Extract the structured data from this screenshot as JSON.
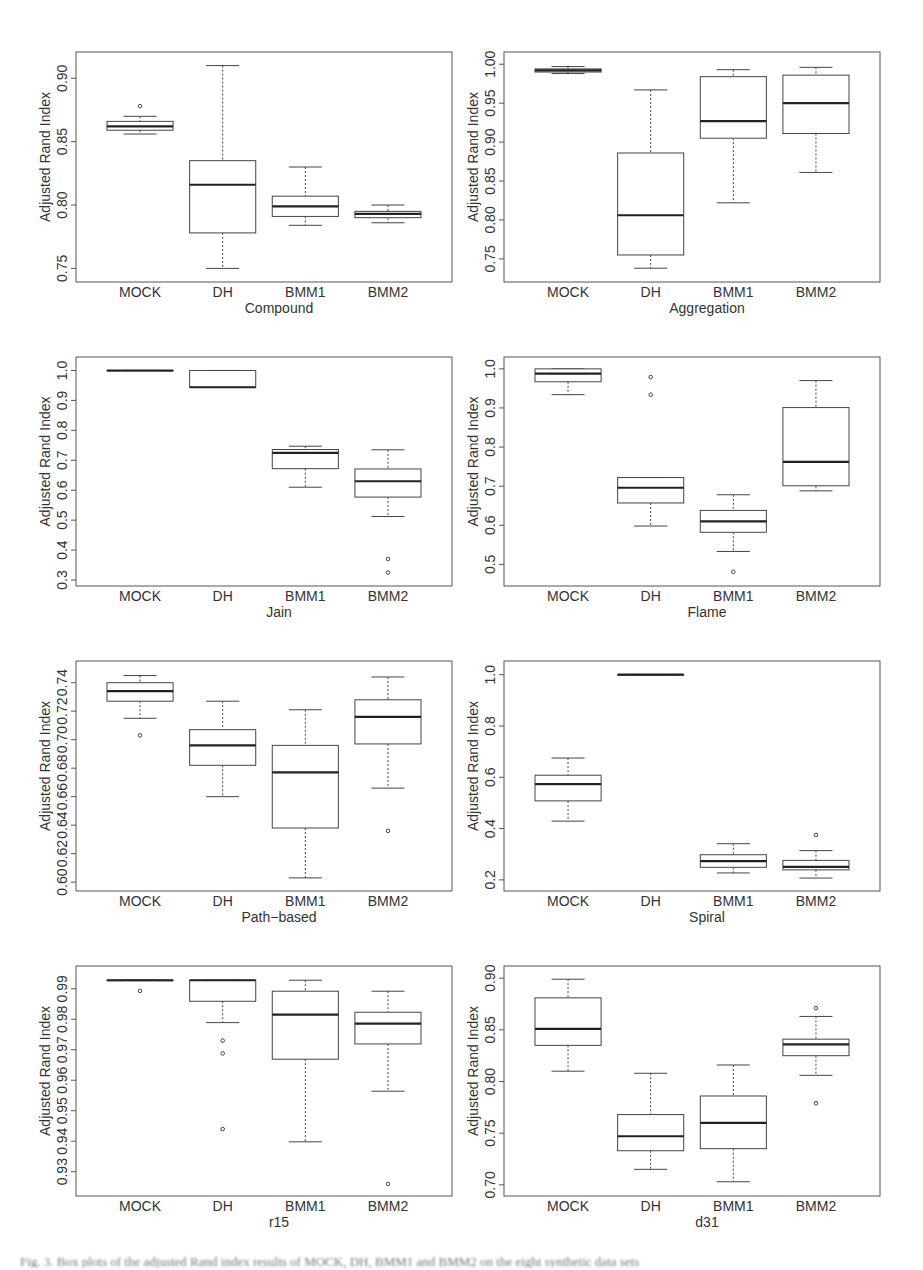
{
  "figure": {
    "caption": "Fig. 3. Box plots of the adjusted Rand index results of MOCK, DH, BMM1 and BMM2 on the eight synthetic data sets",
    "ylabel": "Adjusted Rand Index",
    "colors": {
      "frame": "#555555",
      "box": "#444444",
      "median": "#222222",
      "background": "#ffffff"
    }
  },
  "chart_data": [
    {
      "type": "boxplot",
      "title": "Compound",
      "xlabel": "Compound",
      "ylabel": "Adjusted Rand Index",
      "categories": [
        "MOCK",
        "DH",
        "BMM1",
        "BMM2"
      ],
      "yticks": [
        0.75,
        0.8,
        0.85,
        0.9
      ],
      "ytick_labels": [
        "0.75",
        "0.80",
        "0.85",
        "0.90"
      ],
      "ylim": [
        0.744,
        0.916
      ],
      "boxes": [
        {
          "min": 0.856,
          "q1": 0.859,
          "median": 0.862,
          "q3": 0.866,
          "max": 0.87,
          "outliers": [
            0.878
          ]
        },
        {
          "min": 0.75,
          "q1": 0.778,
          "median": 0.816,
          "q3": 0.835,
          "max": 0.91,
          "outliers": []
        },
        {
          "min": 0.784,
          "q1": 0.791,
          "median": 0.799,
          "q3": 0.807,
          "max": 0.83,
          "outliers": []
        },
        {
          "min": 0.786,
          "q1": 0.79,
          "median": 0.793,
          "q3": 0.795,
          "max": 0.8,
          "outliers": []
        }
      ]
    },
    {
      "type": "boxplot",
      "title": "Aggregation",
      "xlabel": "Aggregation",
      "ylabel": "Adjusted Rand Index",
      "categories": [
        "MOCK",
        "DH",
        "BMM1",
        "BMM2"
      ],
      "yticks": [
        0.75,
        0.8,
        0.85,
        0.9,
        0.95,
        1.0
      ],
      "ytick_labels": [
        "0.75",
        "0.80",
        "0.85",
        "0.90",
        "0.95",
        "1.00"
      ],
      "ylim": [
        0.728,
        1.008
      ],
      "boxes": [
        {
          "min": 0.988,
          "q1": 0.99,
          "median": 0.992,
          "q3": 0.994,
          "max": 0.997,
          "outliers": []
        },
        {
          "min": 0.738,
          "q1": 0.755,
          "median": 0.806,
          "q3": 0.886,
          "max": 0.967,
          "outliers": []
        },
        {
          "min": 0.822,
          "q1": 0.905,
          "median": 0.927,
          "q3": 0.984,
          "max": 0.993,
          "outliers": []
        },
        {
          "min": 0.861,
          "q1": 0.911,
          "median": 0.95,
          "q3": 0.986,
          "max": 0.996,
          "outliers": []
        }
      ]
    },
    {
      "type": "boxplot",
      "title": "Jain",
      "xlabel": "Jain",
      "ylabel": "Adjusted Rand Index",
      "categories": [
        "MOCK",
        "DH",
        "BMM1",
        "BMM2"
      ],
      "yticks": [
        0.3,
        0.4,
        0.5,
        0.6,
        0.7,
        0.8,
        0.9,
        1.0
      ],
      "ytick_labels": [
        "0.3",
        "0.4",
        "0.5",
        "0.6",
        "0.7",
        "0.8",
        "0.9",
        "1.0"
      ],
      "ylim": [
        0.3,
        1.025
      ],
      "boxes": [
        {
          "min": 1.0,
          "q1": 1.0,
          "median": 1.0,
          "q3": 1.0,
          "max": 1.0,
          "outliers": []
        },
        {
          "min": 0.944,
          "q1": 0.944,
          "median": 0.944,
          "q3": 1.0,
          "max": 1.0,
          "outliers": []
        },
        {
          "min": 0.61,
          "q1": 0.672,
          "median": 0.725,
          "q3": 0.736,
          "max": 0.747,
          "outliers": []
        },
        {
          "min": 0.512,
          "q1": 0.577,
          "median": 0.63,
          "q3": 0.671,
          "max": 0.735,
          "outliers": [
            0.37,
            0.325
          ]
        }
      ]
    },
    {
      "type": "boxplot",
      "title": "Flame",
      "xlabel": "Flame",
      "ylabel": "Adjusted Rand Index",
      "categories": [
        "MOCK",
        "DH",
        "BMM1",
        "BMM2"
      ],
      "yticks": [
        0.5,
        0.6,
        0.7,
        0.8,
        0.9,
        1.0
      ],
      "ytick_labels": [
        "0.5",
        "0.6",
        "0.7",
        "0.8",
        "0.9",
        "1.0"
      ],
      "ylim": [
        0.46,
        1.015
      ],
      "boxes": [
        {
          "min": 0.934,
          "q1": 0.967,
          "median": 0.988,
          "q3": 1.0,
          "max": 1.0,
          "outliers": []
        },
        {
          "min": 0.598,
          "q1": 0.657,
          "median": 0.696,
          "q3": 0.722,
          "max": 0.722,
          "outliers": [
            0.979,
            0.934
          ]
        },
        {
          "min": 0.533,
          "q1": 0.582,
          "median": 0.61,
          "q3": 0.638,
          "max": 0.678,
          "outliers": [
            0.481
          ]
        },
        {
          "min": 0.688,
          "q1": 0.701,
          "median": 0.762,
          "q3": 0.901,
          "max": 0.97,
          "outliers": []
        }
      ]
    },
    {
      "type": "boxplot",
      "title": "Path-based",
      "xlabel": "Path−based",
      "ylabel": "Adjusted Rand Index",
      "categories": [
        "MOCK",
        "DH",
        "BMM1",
        "BMM2"
      ],
      "yticks": [
        0.6,
        0.62,
        0.64,
        0.66,
        0.68,
        0.7,
        0.72,
        0.74
      ],
      "ytick_labels": [
        "0.60",
        "0.62",
        "0.64",
        "0.66",
        "0.68",
        "0.70",
        "0.72",
        "0.74"
      ],
      "ylim": [
        0.598,
        0.751
      ],
      "boxes": [
        {
          "min": 0.715,
          "q1": 0.727,
          "median": 0.734,
          "q3": 0.74,
          "max": 0.745,
          "outliers": [
            0.703
          ]
        },
        {
          "min": 0.66,
          "q1": 0.682,
          "median": 0.696,
          "q3": 0.707,
          "max": 0.727,
          "outliers": []
        },
        {
          "min": 0.603,
          "q1": 0.638,
          "median": 0.677,
          "q3": 0.696,
          "max": 0.721,
          "outliers": []
        },
        {
          "min": 0.666,
          "q1": 0.697,
          "median": 0.716,
          "q3": 0.728,
          "max": 0.744,
          "outliers": [
            0.636
          ]
        }
      ]
    },
    {
      "type": "boxplot",
      "title": "Spiral",
      "xlabel": "Spiral",
      "ylabel": "Adjusted Rand Index",
      "categories": [
        "MOCK",
        "DH",
        "BMM1",
        "BMM2"
      ],
      "yticks": [
        0.2,
        0.4,
        0.6,
        0.8,
        1.0
      ],
      "ytick_labels": [
        "0.2",
        "0.4",
        "0.6",
        "0.8",
        "1.0"
      ],
      "ylim": [
        0.18,
        1.03
      ],
      "boxes": [
        {
          "min": 0.429,
          "q1": 0.508,
          "median": 0.573,
          "q3": 0.608,
          "max": 0.675,
          "outliers": []
        },
        {
          "min": 1.0,
          "q1": 1.0,
          "median": 1.0,
          "q3": 1.0,
          "max": 1.0,
          "outliers": []
        },
        {
          "min": 0.227,
          "q1": 0.249,
          "median": 0.273,
          "q3": 0.298,
          "max": 0.341,
          "outliers": []
        },
        {
          "min": 0.207,
          "q1": 0.239,
          "median": 0.251,
          "q3": 0.276,
          "max": 0.314,
          "outliers": [
            0.375
          ]
        }
      ]
    },
    {
      "type": "boxplot",
      "title": "r15",
      "xlabel": "r15",
      "ylabel": "Adjusted Rand Index",
      "categories": [
        "MOCK",
        "DH",
        "BMM1",
        "BMM2"
      ],
      "yticks": [
        0.93,
        0.94,
        0.95,
        0.96,
        0.97,
        0.98,
        0.99
      ],
      "ytick_labels": [
        "0.93",
        "0.94",
        "0.95",
        "0.96",
        "0.97",
        "0.98",
        "0.99"
      ],
      "ylim": [
        0.924,
        0.9955
      ],
      "boxes": [
        {
          "min": 0.9928,
          "q1": 0.9928,
          "median": 0.9928,
          "q3": 0.9928,
          "max": 0.9928,
          "outliers": [
            0.9893
          ]
        },
        {
          "min": 0.9789,
          "q1": 0.9859,
          "median": 0.9928,
          "q3": 0.9928,
          "max": 0.9928,
          "outliers": [
            0.973,
            0.9688,
            0.944
          ]
        },
        {
          "min": 0.9398,
          "q1": 0.9669,
          "median": 0.9815,
          "q3": 0.9892,
          "max": 0.9928,
          "outliers": []
        },
        {
          "min": 0.9564,
          "q1": 0.9719,
          "median": 0.9786,
          "q3": 0.9823,
          "max": 0.9892,
          "outliers": [
            0.926
          ]
        }
      ]
    },
    {
      "type": "boxplot",
      "title": "d31",
      "xlabel": "d31",
      "ylabel": "Adjusted Rand Index",
      "categories": [
        "MOCK",
        "DH",
        "BMM1",
        "BMM2"
      ],
      "yticks": [
        0.7,
        0.75,
        0.8,
        0.85,
        0.9
      ],
      "ytick_labels": [
        "0.70",
        "0.75",
        "0.80",
        "0.85",
        "0.90"
      ],
      "ylim": [
        0.695,
        0.906
      ],
      "boxes": [
        {
          "min": 0.81,
          "q1": 0.835,
          "median": 0.851,
          "q3": 0.881,
          "max": 0.899,
          "outliers": []
        },
        {
          "min": 0.715,
          "q1": 0.733,
          "median": 0.747,
          "q3": 0.768,
          "max": 0.808,
          "outliers": []
        },
        {
          "min": 0.703,
          "q1": 0.735,
          "median": 0.76,
          "q3": 0.786,
          "max": 0.816,
          "outliers": []
        },
        {
          "min": 0.806,
          "q1": 0.825,
          "median": 0.836,
          "q3": 0.841,
          "max": 0.863,
          "outliers": [
            0.871,
            0.779
          ]
        }
      ]
    }
  ]
}
